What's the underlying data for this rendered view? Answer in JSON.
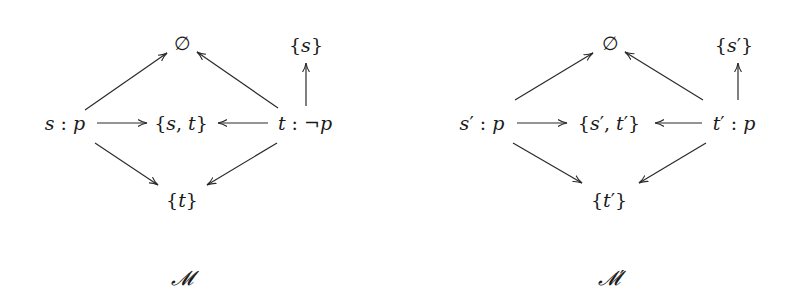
{
  "diagrams": [
    {
      "caption": "𝓜",
      "nodes": {
        "empty": {
          "label": "∅",
          "x": 182,
          "y": 43
        },
        "s_singleton": {
          "label": "{s}",
          "x": 306,
          "y": 45
        },
        "s_world": {
          "label": "s : p",
          "x": 65,
          "y": 123
        },
        "st_set": {
          "label": "{s, t}",
          "x": 181,
          "y": 123
        },
        "t_world": {
          "label": "t : ¬p",
          "x": 305,
          "y": 123
        },
        "t_singleton": {
          "label": "{t}",
          "x": 182,
          "y": 200
        }
      },
      "caption_pos": {
        "x": 182,
        "y": 278
      },
      "edges": [
        {
          "from": "s_world",
          "to": "empty",
          "x1": 85,
          "y1": 110,
          "x2": 167,
          "y2": 53
        },
        {
          "from": "t_world",
          "to": "empty",
          "x1": 278,
          "y1": 108,
          "x2": 197,
          "y2": 52
        },
        {
          "from": "s_world",
          "to": "st_set",
          "x1": 97,
          "y1": 123,
          "x2": 147,
          "y2": 123
        },
        {
          "from": "t_world",
          "to": "st_set",
          "x1": 268,
          "y1": 123,
          "x2": 218,
          "y2": 123
        },
        {
          "from": "s_world",
          "to": "t_singleton",
          "x1": 95,
          "y1": 143,
          "x2": 158,
          "y2": 185
        },
        {
          "from": "t_world",
          "to": "t_singleton",
          "x1": 277,
          "y1": 143,
          "x2": 207,
          "y2": 185
        },
        {
          "from": "t_world",
          "to": "s_singleton",
          "x1": 306,
          "y1": 106,
          "x2": 306,
          "y2": 63
        }
      ]
    },
    {
      "caption": "𝓜′",
      "nodes": {
        "empty": {
          "label": "∅",
          "x": 610,
          "y": 43
        },
        "s_singleton": {
          "label": "{s′}",
          "x": 734,
          "y": 45
        },
        "s_world": {
          "label": "s′ : p",
          "x": 482,
          "y": 123
        },
        "st_set": {
          "label": "{s′, t′}",
          "x": 609,
          "y": 123
        },
        "t_world": {
          "label": "t′ : p",
          "x": 734,
          "y": 123
        },
        "t_singleton": {
          "label": "{t′}",
          "x": 609,
          "y": 200
        }
      },
      "caption_pos": {
        "x": 611,
        "y": 278
      },
      "edges": [
        {
          "from": "s_world",
          "to": "empty",
          "x1": 515,
          "y1": 100,
          "x2": 593,
          "y2": 53
        },
        {
          "from": "t_world",
          "to": "empty",
          "x1": 703,
          "y1": 100,
          "x2": 625,
          "y2": 52
        },
        {
          "from": "s_world",
          "to": "st_set",
          "x1": 517,
          "y1": 123,
          "x2": 567,
          "y2": 123
        },
        {
          "from": "t_world",
          "to": "st_set",
          "x1": 702,
          "y1": 123,
          "x2": 655,
          "y2": 123
        },
        {
          "from": "s_world",
          "to": "t_singleton",
          "x1": 513,
          "y1": 143,
          "x2": 582,
          "y2": 183
        },
        {
          "from": "t_world",
          "to": "t_singleton",
          "x1": 706,
          "y1": 143,
          "x2": 639,
          "y2": 183
        },
        {
          "from": "t_world",
          "to": "s_singleton",
          "x1": 738,
          "y1": 100,
          "x2": 738,
          "y2": 63
        }
      ]
    }
  ],
  "style": {
    "ink": "#1a1a1a",
    "edge": "#2a2a2a",
    "background": "#ffffff"
  }
}
